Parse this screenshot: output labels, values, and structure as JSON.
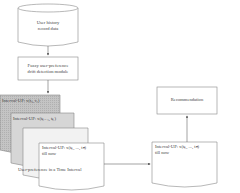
{
  "nodes": {
    "database": {
      "line1": "User history",
      "line2": "record data"
    },
    "module": {
      "line1": "Fuzzy user-preference",
      "line2": "drift detection module"
    },
    "stack": {
      "card1": "Interval-UP: x(t₀, t₁)",
      "card2": "Interval-UP: x(tₖ₋₁, tₖ)",
      "card4_line1": "Interval-UP: x(tₖ, ..., tₙ)",
      "card4_line2": "till now",
      "caption": "User-preference in a Time Interval"
    },
    "selected": {
      "line1": "Interval-UP: x(tₖ, ..., tₙ)",
      "line2": "till now"
    },
    "recommendation": {
      "label": "Recommendation"
    }
  },
  "colors": {
    "stroke": "#888888",
    "card1_fill": "#c8c8c8",
    "card2_fill": "#dcdcdc",
    "card3_fill": "#f0f0f0",
    "card4_fill": "#ffffff"
  }
}
